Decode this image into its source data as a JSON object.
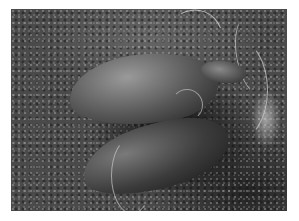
{
  "image": {
    "description": "Grayscale scanning electron micrograph of two pear-shaped flagellated protozoan cells on a granular textured surface",
    "alt": "SEM micrograph of two flagellated cells on a textured surface",
    "colors": {
      "border": "#ffffff",
      "background_mid": "#4a4a4a",
      "highlight": "#9a9a9a",
      "shadow": "#1a1a1a"
    }
  }
}
